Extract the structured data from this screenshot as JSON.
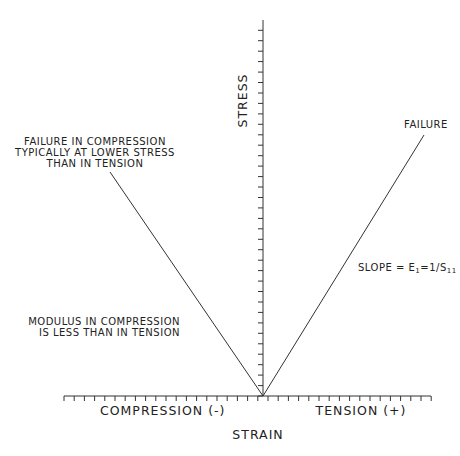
{
  "chart_data": {
    "type": "line",
    "title": "",
    "xlabel": "STRAIN",
    "ylabel": "STRESS",
    "x_sections": [
      "COMPRESSION (-)",
      "TENSION (+)"
    ],
    "grid": false,
    "series": [
      {
        "name": "tension",
        "points": [
          [
            0,
            0
          ],
          [
            1.6,
            2.5
          ]
        ],
        "end_label": "FAILURE"
      },
      {
        "name": "compression",
        "points": [
          [
            0,
            0
          ],
          [
            -1.5,
            2.1
          ]
        ]
      }
    ],
    "annotations": [
      "FAILURE",
      "SLOPE = E1=1/S11",
      "FAILURE IN COMPRESSION TYPICALLY AT LOWER STRESS THAN IN TENSION",
      "MODULUS IN COMPRESSION IS LESS THAN IN TENSION"
    ]
  },
  "labels": {
    "ylabel": "STRESS",
    "xlabel": "STRAIN",
    "compression": "COMPRESSION (-)",
    "tension": "TENSION (+)",
    "failure": "FAILURE",
    "slope_prefix": "SLOPE = E",
    "slope_sub1": "1",
    "slope_mid": "=1/S",
    "slope_sub2": "11",
    "comp_failure_1": "FAILURE IN COMPRESSION",
    "comp_failure_2": "TYPICALLY AT LOWER STRESS",
    "comp_failure_3": "THAN IN TENSION",
    "modulus_1": "MODULUS IN COMPRESSION",
    "modulus_2": "IS LESS THAN IN TENSION"
  }
}
